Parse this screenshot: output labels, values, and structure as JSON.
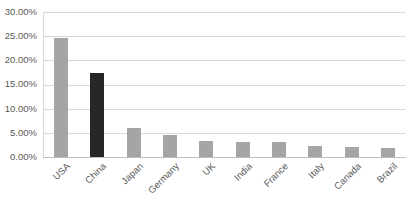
{
  "chart_data": {
    "type": "bar",
    "title": "",
    "subtitle": "",
    "xlabel": "",
    "ylabel": "",
    "categories": [
      "USA",
      "China",
      "Japan",
      "Germany",
      "UK",
      "India",
      "France",
      "Italy",
      "Canada",
      "Brazil"
    ],
    "values": [
      24.6,
      17.4,
      5.9,
      4.6,
      3.3,
      3.2,
      3.2,
      2.3,
      2.0,
      1.8
    ],
    "value_format": "percent",
    "ylim": [
      0,
      30
    ],
    "ytick_values": [
      30,
      25,
      20,
      15,
      10,
      5,
      0
    ],
    "ytick_labels": [
      "30.00%",
      "25.00%",
      "20.00%",
      "15.00%",
      "10.00%",
      "5.00%",
      "0.00%"
    ],
    "grid": true,
    "grid_axis": "y",
    "legend": false,
    "legend_position": "none",
    "series": [
      {
        "name": "Share",
        "values": [
          24.6,
          17.4,
          5.9,
          4.6,
          3.3,
          3.2,
          3.2,
          2.3,
          2.0,
          1.8
        ]
      }
    ],
    "bar_colors": [
      "#a5a5a5",
      "#262626",
      "#a5a5a5",
      "#a5a5a5",
      "#a5a5a5",
      "#a5a5a5",
      "#a5a5a5",
      "#a5a5a5",
      "#a5a5a5",
      "#a5a5a5"
    ],
    "highlight_category": "China",
    "xtick_rotation": -45,
    "colors": {
      "bar_default": "#a5a5a5",
      "bar_highlight": "#262626",
      "gridline": "#d9d9d9",
      "axis": "#bfbfbf",
      "tick_label": "#595959",
      "background": "#ffffff"
    }
  }
}
